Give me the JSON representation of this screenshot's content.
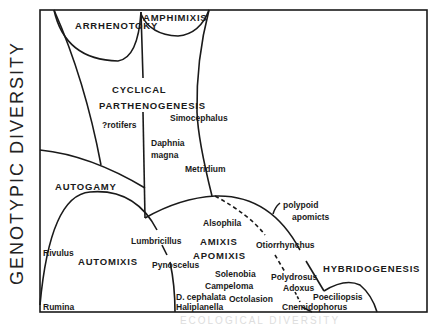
{
  "axes": {
    "y_label": "GENOTYPIC DIVERSITY",
    "x_label": "ECOLOGICAL DIVERSITY"
  },
  "regions": {
    "arrhenotoky": "ARRHENOTOKY",
    "amphimixis": "AMPHIMIXIS",
    "cyclical": "CYCLICAL",
    "parthenogenesis": "PARTHENOGENESIS",
    "autogamy": "AUTOGAMY",
    "automixis": "AUTOMIXIS",
    "amixis": "AMIXIS",
    "apomixis": "APOMIXIS",
    "hybridogenesis": "HYBRIDOGENESIS"
  },
  "taxa": {
    "rotifers": "?rotifers",
    "simocephalus": "Simocephalus",
    "daphnia": "Daphnia",
    "magna": "magna",
    "metridium": "Metridium",
    "polypoid": "polypoid",
    "apomicts": "apomicts",
    "alsophila": "Alsophila",
    "lumbricillus": "Lumbricillus",
    "otiorrhynchus": "Otiorrhynchus",
    "rivulus": "Rivulus",
    "pynoscelus": "Pynoscelus",
    "solenobia": "Solenobia",
    "campeloma": "Campeloma",
    "polydrosus": "Polydrosus",
    "adoxus": "Adoxus",
    "d_cephalata": "D. cephalata",
    "octolasion": "Octolasion",
    "poeciliopsis": "Poeciliopsis",
    "haliplanella": "Haliplanella",
    "cnemidophorus": "Cnemidophorus",
    "rumina": "Rumina"
  },
  "colors": {
    "line": "#1a1a1a",
    "background": "#ffffff"
  }
}
